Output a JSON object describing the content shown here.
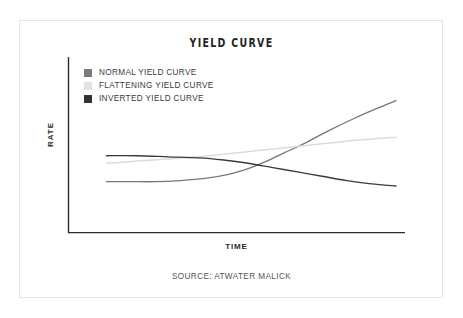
{
  "chart_data": {
    "type": "line",
    "title": "YIELD CURVE",
    "xlabel": "TIME",
    "ylabel": "RATE",
    "source": "SOURCE: ATWATER MALICK",
    "grid": false,
    "legend_position": "top-left",
    "x_tick_labels": [],
    "y_tick_labels": [],
    "xlim": [
      0,
      100
    ],
    "ylim": [
      0,
      100
    ],
    "axis_color": "#2b2b2b",
    "series": [
      {
        "name": "NORMAL YIELD CURVE",
        "color": "#777777",
        "swatch_color": "#7b7b7b",
        "description": "Rises steeply from low start, crossing upward through the other curves",
        "x": [
          6,
          14,
          22,
          30,
          38,
          46,
          52,
          58,
          64,
          70,
          78,
          86,
          94,
          100
        ],
        "y": [
          17,
          17,
          17,
          18,
          20,
          24,
          29,
          36,
          44,
          52,
          64,
          75,
          85,
          92
        ]
      },
      {
        "name": "FLATTENING YIELD CURVE",
        "color": "#dcdcdc",
        "swatch_color": "#e2e2e2",
        "description": "Gently rising, nearly flat line ending mid-height",
        "x": [
          6,
          16,
          26,
          36,
          46,
          56,
          66,
          76,
          86,
          94,
          100
        ],
        "y": [
          34,
          36,
          38,
          40,
          43,
          46,
          49,
          52,
          55,
          57,
          58
        ]
      },
      {
        "name": "INVERTED YIELD CURVE",
        "color": "#3a3a3a",
        "swatch_color": "#333333",
        "description": "Starts high and flat, then declines steadily to a low right end",
        "x": [
          6,
          16,
          26,
          36,
          44,
          52,
          60,
          68,
          76,
          84,
          92,
          100
        ],
        "y": [
          41,
          41,
          40,
          39,
          37,
          34,
          30,
          26,
          22,
          18,
          15,
          13
        ]
      }
    ]
  },
  "footer": {
    "source": "SOURCE: ATWATER MALICK"
  }
}
